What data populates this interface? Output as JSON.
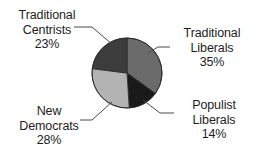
{
  "chart_data": {
    "type": "pie",
    "title": "",
    "xlabel": "",
    "ylabel": "",
    "legend_position": "outside-callouts",
    "grid": false,
    "start_angle_deg": 0,
    "direction": "clockwise",
    "center": {
      "x": 127,
      "y": 73,
      "radius": 35
    },
    "categories": [
      "Traditional Liberals",
      "Populist Liberals",
      "New Democrats",
      "Traditional Centrists"
    ],
    "values": [
      35,
      14,
      28,
      23
    ],
    "value_suffix": "%",
    "colors": [
      "#6b6b6b",
      "#1a1a1a",
      "#b3b3b3",
      "#3c3c3c"
    ],
    "slices": [
      {
        "name": "Traditional Liberals",
        "label_line1": "Traditional",
        "label_line2": "Liberals",
        "value": 35,
        "value_text": "35%",
        "color": "#6b6b6b"
      },
      {
        "name": "Populist Liberals",
        "label_line1": "Populist",
        "label_line2": "Liberals",
        "value": 14,
        "value_text": "14%",
        "color": "#1a1a1a"
      },
      {
        "name": "New Democrats",
        "label_line1": "New",
        "label_line2": "Democrats",
        "value": 28,
        "value_text": "28%",
        "color": "#b3b3b3"
      },
      {
        "name": "Traditional Centrists",
        "label_line1": "Traditional",
        "label_line2": "Centrists",
        "value": 23,
        "value_text": "23%",
        "color": "#3c3c3c"
      }
    ]
  },
  "style": {
    "background": "#ffffff",
    "text_color": "#1d1d1d",
    "leader_line_color": "#4a4a4a",
    "slice_outline_color": "#2a2a2a"
  }
}
